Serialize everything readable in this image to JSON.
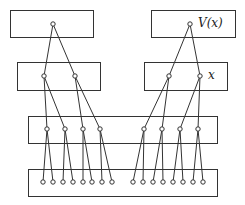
{
  "diagram": {
    "type": "tree-of-boxes",
    "stroke_color": "#333333",
    "background": "#ffffff",
    "levels": [
      {
        "name": "level-1",
        "boxes": [
          {
            "id": "top-left",
            "x": 10,
            "y": 10,
            "w": 83,
            "h": 27,
            "label": "",
            "nodes": [
              [
                53,
                24
              ]
            ]
          },
          {
            "id": "top-right",
            "x": 151,
            "y": 10,
            "w": 84,
            "h": 27,
            "label": "V(x)",
            "nodes": [
              [
                190,
                24
              ]
            ]
          }
        ]
      },
      {
        "name": "level-2",
        "boxes": [
          {
            "id": "mid-left",
            "x": 17,
            "y": 62,
            "w": 83,
            "h": 28,
            "label": "",
            "nodes": [
              [
                44,
                76
              ],
              [
                75,
                76
              ]
            ]
          },
          {
            "id": "mid-right",
            "x": 144,
            "y": 62,
            "w": 83,
            "h": 28,
            "label": "x",
            "nodes": [
              [
                169,
                76
              ],
              [
                200,
                76
              ]
            ]
          }
        ]
      },
      {
        "name": "level-3",
        "boxes": [
          {
            "id": "wide-3",
            "x": 28,
            "y": 116,
            "w": 189,
            "h": 27,
            "label": "",
            "nodes": [
              [
                47,
                129
              ],
              [
                65,
                129
              ],
              [
                83,
                129
              ],
              [
                100,
                129
              ],
              [
                144,
                129
              ],
              [
                162,
                129
              ],
              [
                180,
                129
              ],
              [
                198,
                129
              ]
            ]
          }
        ]
      },
      {
        "name": "level-4",
        "boxes": [
          {
            "id": "wide-4",
            "x": 28,
            "y": 169,
            "w": 189,
            "h": 27,
            "label": "",
            "nodes": [
              [
                43,
                182
              ],
              [
                53,
                182
              ],
              [
                63,
                182
              ],
              [
                73,
                182
              ],
              [
                83,
                182
              ],
              [
                92,
                182
              ],
              [
                102,
                182
              ],
              [
                112,
                182
              ],
              [
                133,
                182
              ],
              [
                143,
                182
              ],
              [
                153,
                182
              ],
              [
                163,
                182
              ],
              [
                173,
                182
              ],
              [
                183,
                182
              ],
              [
                193,
                182
              ],
              [
                203,
                182
              ]
            ]
          }
        ]
      }
    ],
    "edges": [
      [
        [
          53,
          24
        ],
        [
          44,
          76
        ]
      ],
      [
        [
          53,
          24
        ],
        [
          75,
          76
        ]
      ],
      [
        [
          190,
          24
        ],
        [
          169,
          76
        ]
      ],
      [
        [
          190,
          24
        ],
        [
          200,
          76
        ]
      ],
      [
        [
          44,
          76
        ],
        [
          47,
          129
        ]
      ],
      [
        [
          44,
          76
        ],
        [
          65,
          129
        ]
      ],
      [
        [
          75,
          76
        ],
        [
          83,
          129
        ]
      ],
      [
        [
          75,
          76
        ],
        [
          100,
          129
        ]
      ],
      [
        [
          169,
          76
        ],
        [
          144,
          129
        ]
      ],
      [
        [
          169,
          76
        ],
        [
          162,
          129
        ]
      ],
      [
        [
          200,
          76
        ],
        [
          180,
          129
        ]
      ],
      [
        [
          200,
          76
        ],
        [
          198,
          129
        ]
      ],
      [
        [
          47,
          129
        ],
        [
          43,
          182
        ]
      ],
      [
        [
          47,
          129
        ],
        [
          53,
          182
        ]
      ],
      [
        [
          65,
          129
        ],
        [
          63,
          182
        ]
      ],
      [
        [
          65,
          129
        ],
        [
          73,
          182
        ]
      ],
      [
        [
          83,
          129
        ],
        [
          83,
          182
        ]
      ],
      [
        [
          83,
          129
        ],
        [
          92,
          182
        ]
      ],
      [
        [
          100,
          129
        ],
        [
          102,
          182
        ]
      ],
      [
        [
          100,
          129
        ],
        [
          112,
          182
        ]
      ],
      [
        [
          144,
          129
        ],
        [
          133,
          182
        ]
      ],
      [
        [
          144,
          129
        ],
        [
          143,
          182
        ]
      ],
      [
        [
          162,
          129
        ],
        [
          153,
          182
        ]
      ],
      [
        [
          162,
          129
        ],
        [
          163,
          182
        ]
      ],
      [
        [
          180,
          129
        ],
        [
          173,
          182
        ]
      ],
      [
        [
          180,
          129
        ],
        [
          183,
          182
        ]
      ],
      [
        [
          198,
          129
        ],
        [
          193,
          182
        ]
      ],
      [
        [
          198,
          129
        ],
        [
          203,
          182
        ]
      ]
    ],
    "labels": {
      "top_right": "V(x)",
      "mid_right": "x"
    }
  }
}
